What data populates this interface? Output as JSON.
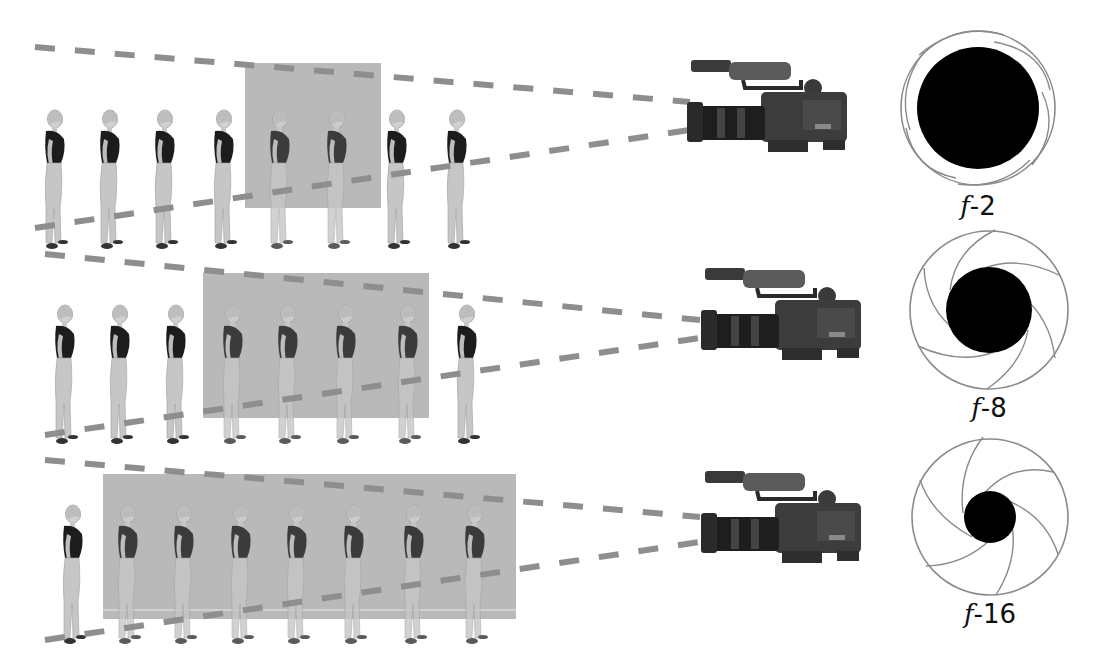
{
  "colors": {
    "focus_box": "#b9b9b9",
    "dash_line": "#8e8e8e",
    "shirt": "#1a1a1a",
    "pants": "#c4c4c4",
    "iris_ring": "#8a8a8a",
    "aperture": "#000000"
  },
  "rows": [
    {
      "f_stop": "f-2",
      "f_letter": "f",
      "f_number": "-2",
      "figure_count": 8,
      "figure_x": [
        55,
        110,
        165,
        224,
        280,
        337,
        397,
        457
      ],
      "focus_box": {
        "x": 245,
        "y": 63,
        "w": 136,
        "h": 145
      },
      "dash_top": {
        "x1": 35,
        "y1": 47,
        "x2": 690,
        "y2": 102
      },
      "dash_bottom": {
        "x1": 35,
        "y1": 228,
        "x2": 690,
        "y2": 130
      },
      "camera_y": 60,
      "iris": {
        "cx": 978,
        "cy": 108,
        "r": 77,
        "hole_r": 61
      },
      "label_y": 190
    },
    {
      "f_stop": "f-8",
      "f_letter": "f",
      "f_number": "-8",
      "figure_count": 8,
      "figure_x": [
        65,
        120,
        176,
        233,
        288,
        346,
        408,
        467
      ],
      "focus_box": {
        "x": 203,
        "y": 273,
        "w": 226,
        "h": 145
      },
      "dash_top": {
        "x1": 45,
        "y1": 254,
        "x2": 700,
        "y2": 320
      },
      "dash_bottom": {
        "x1": 45,
        "y1": 435,
        "x2": 700,
        "y2": 338
      },
      "camera_y": 268,
      "iris": {
        "cx": 989,
        "cy": 310,
        "r": 79,
        "hole_r": 43
      },
      "label_y": 392
    },
    {
      "f_stop": "f-16",
      "f_letter": "f",
      "f_number": "-16",
      "figure_count": 8,
      "figure_x": [
        73,
        128,
        184,
        241,
        297,
        354,
        414,
        475
      ],
      "focus_box": {
        "x": 103,
        "y": 474,
        "w": 413,
        "h": 145
      },
      "dash_top": {
        "x1": 45,
        "y1": 460,
        "x2": 700,
        "y2": 517
      },
      "dash_bottom": {
        "x1": 45,
        "y1": 640,
        "x2": 700,
        "y2": 542
      },
      "camera_y": 471,
      "iris": {
        "cx": 990,
        "cy": 517,
        "r": 78,
        "hole_r": 26
      },
      "label_y": 596
    }
  ]
}
